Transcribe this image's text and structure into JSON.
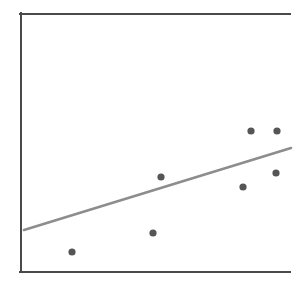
{
  "figure": {
    "width": 305,
    "height": 282,
    "background": "#ffffff"
  },
  "chart_data": {
    "type": "scatter",
    "title": "",
    "subtitle": "",
    "xlabel": "",
    "ylabel": "",
    "grid": false,
    "legend": false,
    "legend_position": "none",
    "axis_frame": {
      "style": "left-top-bottom-only",
      "color": "#4a4a4a",
      "line_width": 2,
      "left_x": 21,
      "right_x": 290,
      "top_y": 14,
      "bottom_y": 272,
      "has_right_spine": false,
      "has_tick_labels": false,
      "has_ticks": false
    },
    "xlim": [
      0,
      10
    ],
    "ylim": [
      0,
      10
    ],
    "point_style": {
      "color": "#555555",
      "radius": 3.6,
      "marker": "circle"
    },
    "points_px": [
      {
        "x": 72,
        "y": 252
      },
      {
        "x": 153,
        "y": 233
      },
      {
        "x": 161,
        "y": 177
      },
      {
        "x": 243,
        "y": 187
      },
      {
        "x": 251,
        "y": 131
      },
      {
        "x": 276,
        "y": 173
      },
      {
        "x": 277,
        "y": 131
      }
    ],
    "x": [
      1.9,
      4.9,
      5.2,
      8.3,
      8.6,
      9.5,
      9.5
    ],
    "y": [
      2.2,
      3.0,
      5.2,
      4.8,
      7.0,
      5.4,
      7.0
    ],
    "series": [
      {
        "name": "observations",
        "x": [
          1.9,
          4.9,
          5.2,
          8.3,
          8.6,
          9.5,
          9.5
        ],
        "y": [
          2.2,
          3.0,
          5.2,
          4.8,
          7.0,
          5.4,
          7.0
        ],
        "color": "#555555"
      }
    ],
    "trendline": {
      "name": "linear fit",
      "color": "#8d8d8d",
      "line_width": 2.6,
      "x0_px": 24,
      "y0_px": 230,
      "x1_px": 291,
      "y1_px": 148,
      "slope_px": -0.307,
      "direction": "positive"
    }
  }
}
